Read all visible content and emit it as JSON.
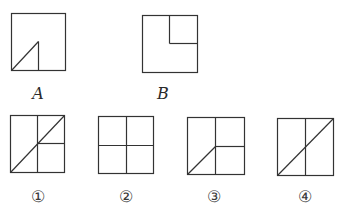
{
  "diagram": {
    "stroke_color": "#333333",
    "background": "#ffffff",
    "figures": [
      {
        "id": "A",
        "label": "A",
        "label_style": "italic",
        "box": {
          "x": 11,
          "y": 13,
          "w": 54,
          "h": 57
        },
        "description": "Square with a right triangle in the bottom-left quarter: diagonal from bottom-left corner to center, vertical line from center down to bottom edge",
        "lines": [
          [
            11,
            70,
            38,
            41
          ],
          [
            38,
            41,
            38,
            70
          ]
        ],
        "label_pos": {
          "x": 38,
          "y": 93
        }
      },
      {
        "id": "B",
        "label": "B",
        "label_style": "italic",
        "box": {
          "x": 142,
          "y": 15,
          "w": 55,
          "h": 57
        },
        "description": "Square with top-right quarter partitioned into a small square",
        "lines": [
          [
            169,
            15,
            169,
            43
          ],
          [
            169,
            43,
            197,
            43
          ]
        ],
        "label_pos": {
          "x": 163,
          "y": 93
        }
      },
      {
        "id": "1",
        "label": "①",
        "label_style": "circled",
        "box": {
          "x": 10,
          "y": 115,
          "w": 54,
          "h": 57
        },
        "description": "Square split vertically in half, right half split horizontally, full diagonal from bottom-left to top-right",
        "lines": [
          [
            37,
            115,
            37,
            172
          ],
          [
            37,
            143,
            64,
            143
          ],
          [
            10,
            172,
            64,
            115
          ]
        ],
        "label_pos": {
          "x": 38,
          "y": 196
        }
      },
      {
        "id": "2",
        "label": "②",
        "label_style": "circled",
        "box": {
          "x": 98,
          "y": 116,
          "w": 55,
          "h": 57
        },
        "description": "Square divided into four equal quarters",
        "lines": [
          [
            126,
            116,
            126,
            173
          ],
          [
            98,
            145,
            153,
            145
          ]
        ],
        "label_pos": {
          "x": 126,
          "y": 196
        }
      },
      {
        "id": "3",
        "label": "③",
        "label_style": "circled",
        "box": {
          "x": 187,
          "y": 117,
          "w": 57,
          "h": 57
        },
        "description": "Square split vertically in half, right half split horizontally, half diagonal from bottom-left to center",
        "lines": [
          [
            215,
            117,
            215,
            174
          ],
          [
            215,
            146,
            244,
            146
          ],
          [
            187,
            174,
            215,
            146
          ]
        ],
        "label_pos": {
          "x": 214,
          "y": 196
        }
      },
      {
        "id": "4",
        "label": "④",
        "label_style": "circled",
        "box": {
          "x": 277,
          "y": 118,
          "w": 56,
          "h": 57
        },
        "description": "Square split vertically in half with full diagonal from bottom-left to top-right",
        "lines": [
          [
            305,
            118,
            305,
            175
          ],
          [
            277,
            175,
            333,
            118
          ]
        ],
        "label_pos": {
          "x": 305,
          "y": 196
        }
      }
    ]
  }
}
